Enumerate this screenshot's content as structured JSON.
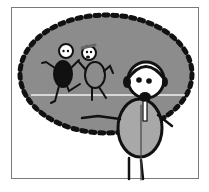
{
  "illustration": {
    "description": "Cartoon of a presenter stick figure wearing a headset with a microphone, gesturing toward a thought bubble showing two stick figures running on a line",
    "colors": {
      "bubble_fill": "#8c8c8c",
      "bubble_dots": "#111111",
      "frame_border": "#7a7a7a",
      "body_fill": "#a8a8a8",
      "background": "#ffffff"
    }
  }
}
